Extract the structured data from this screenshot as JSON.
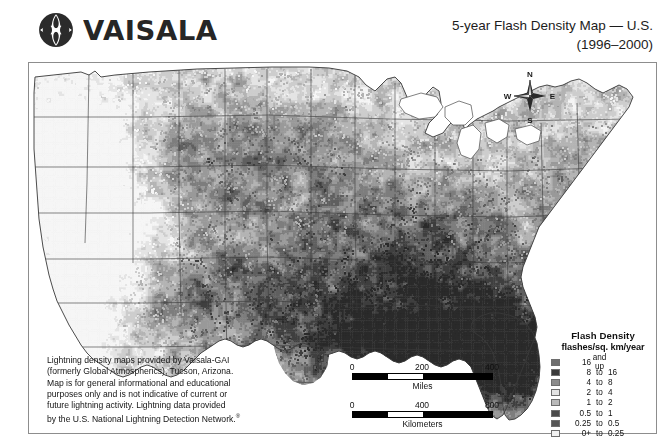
{
  "header": {
    "brand_name": "VAISALA",
    "logo_icon": "vaisala-logo-icon",
    "title_line1": "5-year Flash Density Map — U.S.",
    "title_line2": "(1996–2000)"
  },
  "compass": {
    "icon": "compass-rose-icon",
    "north": "N",
    "east": "E",
    "south": "S",
    "west": "W"
  },
  "caption": {
    "line1": "Lightning density maps provided by Vaisala-GAI",
    "line2": "(formerly Global Atmospherics), Tucson, Arizona.",
    "line3": "Map is for general informational and educational",
    "line4": "purposes only and is not indicative of current or",
    "line5": "future lightning activity. Lightning data provided",
    "line6": "by the U.S. National Lightning Detection Network.",
    "registered_mark": "®"
  },
  "scales": [
    {
      "unit_label": "Miles",
      "ticks": [
        "0",
        "200",
        "400"
      ]
    },
    {
      "unit_label": "Kilometers",
      "ticks": [
        "0",
        "400",
        "800"
      ]
    }
  ],
  "legend": {
    "title": "Flash Density",
    "subtitle": "flashes/sq. km/year",
    "rows": [
      {
        "color": "#6e6e6e",
        "from": "16",
        "to": "and up",
        "upper": ""
      },
      {
        "color": "#3a3a3a",
        "from": "8",
        "to": "to",
        "upper": "16"
      },
      {
        "color": "#8c8c8c",
        "from": "4",
        "to": "to",
        "upper": "8"
      },
      {
        "color": "#e2e2e2",
        "from": "2",
        "to": "to",
        "upper": "4"
      },
      {
        "color": "#b9b9b9",
        "from": "1",
        "to": "to",
        "upper": "2"
      },
      {
        "color": "#4a4a4a",
        "from": "0.5",
        "to": "to",
        "upper": "1"
      },
      {
        "color": "#565656",
        "from": "0.25",
        "to": "to",
        "upper": "0.5"
      },
      {
        "color": "#f2f2f2",
        "from": "0+",
        "to": "to",
        "upper": "0.25"
      }
    ]
  },
  "map": {
    "name": "us-flash-density-map",
    "region": "Contiguous United States",
    "background": "#ffffff",
    "border_color": "#8d8d8d",
    "state_line_color": "#5a5a5a",
    "density_notes": {
      "highest": [
        "Florida",
        "Gulf Coast",
        "Louisiana",
        "Mississippi"
      ],
      "high": [
        "Southeast",
        "Central Plains",
        "Midwest"
      ],
      "moderate": [
        "Rocky Mountains",
        "Northern Plains",
        "Northeast"
      ],
      "lowest": [
        "Pacific Northwest",
        "California",
        "Great Basin"
      ]
    }
  }
}
